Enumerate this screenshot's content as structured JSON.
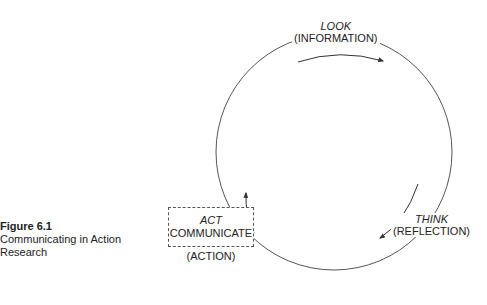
{
  "caption": {
    "number": "Figure 6.1",
    "title": "Communicating in Action Research"
  },
  "nodes": {
    "look": {
      "verb": "LOOK",
      "phase": "(INFORMATION)"
    },
    "think": {
      "verb": "THINK",
      "phase": "(REFLECTION)"
    },
    "act": {
      "verb": "ACT",
      "extra": "COMMUNICATE",
      "phase": "(ACTION)"
    }
  },
  "colors": {
    "line": "#555555",
    "text": "#222222"
  }
}
